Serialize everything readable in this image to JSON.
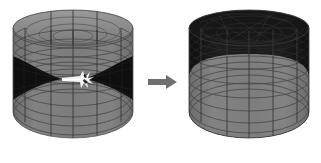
{
  "figure": {
    "background_color": "#ffffff",
    "width": 321,
    "height": 163
  },
  "colors": {
    "background": "#ffffff",
    "mesh_gray": "#787878",
    "mesh_gray_light": "#8c8c8c",
    "mesh_gray_dark": "#6a6a6a",
    "mesh_dark": "#1a1a1a",
    "mesh_dark_soft": "#262626",
    "grid_line": "#3c3c3c",
    "grid_line_dark": "#000000",
    "arrow": "#707070",
    "burst_white": "#f4f4f4"
  },
  "panels": [
    {
      "id": "left-cylinder",
      "name": "cylinder-before",
      "label": "",
      "region_shading": "gray",
      "band_shading": "dark",
      "ring_count": 11,
      "meridian_count": 4,
      "has_burst": true,
      "burst_label": "",
      "bounds": {
        "x": 13,
        "y": 12,
        "width": 120,
        "height": 128
      }
    },
    {
      "id": "right-cylinder",
      "name": "cylinder-after",
      "label": "",
      "region_shading": "dark",
      "dome_shading": "gray",
      "ring_count": 7,
      "meridian_count": 4,
      "has_burst": false,
      "bounds": {
        "x": 189,
        "y": 12,
        "width": 120,
        "height": 128
      }
    }
  ],
  "arrow": {
    "name": "transition-arrow",
    "direction": "right",
    "label": "",
    "color": "#707070",
    "bounds": {
      "x": 148,
      "y": 76,
      "width": 30,
      "height": 12
    }
  }
}
